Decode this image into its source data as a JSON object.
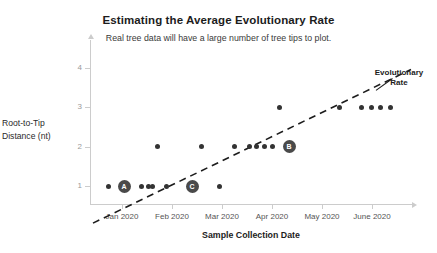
{
  "chart_data": {
    "type": "scatter",
    "title": "Estimating the Average Evolutionary Rate",
    "subtitle": "Real tree data will have a large number of tree tips to plot.",
    "xlabel": "Sample Collection Date",
    "ylabel": "Root-to-Tip Distance (nt)",
    "grid": false,
    "legend": false,
    "xlim": [
      0,
      6.4
    ],
    "ylim": [
      0,
      4.2
    ],
    "xticks": [
      {
        "value": 0.64,
        "label": "Jan 2020"
      },
      {
        "value": 1.64,
        "label": "Feb 2020"
      },
      {
        "value": 2.64,
        "label": "Mar 2020"
      },
      {
        "value": 3.64,
        "label": "Apr 2020"
      },
      {
        "value": 4.64,
        "label": "May 2020"
      },
      {
        "value": 5.64,
        "label": "June 2020"
      }
    ],
    "yticks": [
      {
        "value": 1,
        "label": "1"
      },
      {
        "value": 2,
        "label": "2"
      },
      {
        "value": 3,
        "label": "3"
      },
      {
        "value": 4,
        "label": "4"
      }
    ],
    "points": [
      {
        "x": 0.36,
        "y": 1
      },
      {
        "x": 0.68,
        "y": 1,
        "label": "A"
      },
      {
        "x": 1.02,
        "y": 1
      },
      {
        "x": 1.16,
        "y": 1
      },
      {
        "x": 1.24,
        "y": 1
      },
      {
        "x": 1.52,
        "y": 1
      },
      {
        "x": 2.04,
        "y": 1,
        "label": "C"
      },
      {
        "x": 2.58,
        "y": 1
      },
      {
        "x": 1.34,
        "y": 2
      },
      {
        "x": 2.22,
        "y": 2
      },
      {
        "x": 2.88,
        "y": 2
      },
      {
        "x": 3.18,
        "y": 2
      },
      {
        "x": 3.32,
        "y": 2
      },
      {
        "x": 3.48,
        "y": 2
      },
      {
        "x": 3.64,
        "y": 2
      },
      {
        "x": 3.98,
        "y": 2,
        "label": "B"
      },
      {
        "x": 3.78,
        "y": 3
      },
      {
        "x": 4.98,
        "y": 3
      },
      {
        "x": 5.42,
        "y": 3
      },
      {
        "x": 5.62,
        "y": 3
      },
      {
        "x": 5.8,
        "y": 3
      },
      {
        "x": 6.0,
        "y": 3
      }
    ],
    "trendline": {
      "style": "dashed",
      "color": "#1c1c1c",
      "x_start": 0.06,
      "y_start": 0.06,
      "x_end": 6.42,
      "y_end": 3.95
    },
    "annotations": [
      {
        "name": "evolutionary-rate",
        "text": "Evolutionary Rate",
        "line1": "Evolutionary",
        "line2": "Rate",
        "pointer_from_x": 5.72,
        "pointer_from_y": 3.42,
        "pointer_to_x": 6.05,
        "pointer_to_y": 3.72
      }
    ],
    "colors": {
      "point": "#333333",
      "labeled_point": "#4a4a4a",
      "labeled_point_text": "#ffffff",
      "axis": "#cccccc",
      "trendline": "#1c1c1c",
      "title_text": "#1c1c1c",
      "subtitle_text": "#3a3a3a",
      "tick_text": "#555555",
      "y_tick_text": "#9a9a9a",
      "background": "#ffffff"
    }
  }
}
